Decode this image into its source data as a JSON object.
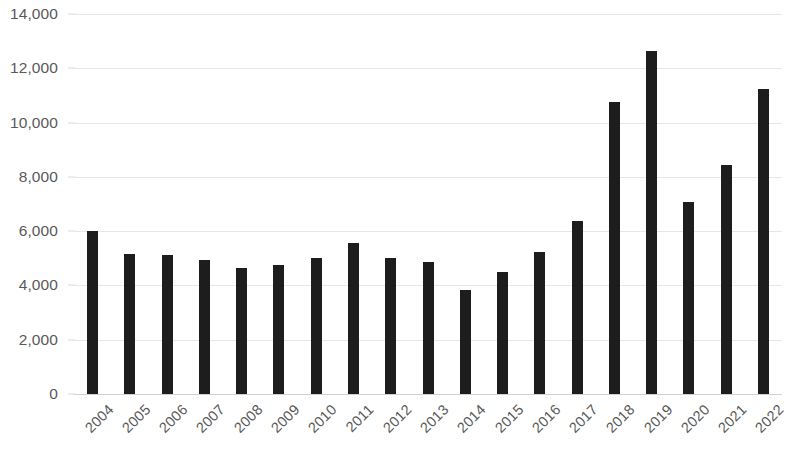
{
  "chart_data": {
    "type": "bar",
    "title": "",
    "subtitle": "",
    "xlabel": "",
    "ylabel": "",
    "legend": [],
    "grid": true,
    "legend_position": "none",
    "bar_color": "#1d1d1d",
    "gridline_color": "#e6e6e6",
    "axis_label_color": "#595959",
    "background_color": "#ffffff",
    "ylim": [
      0,
      14000
    ],
    "ytick_step": 2000,
    "ytick_labels": [
      "14,000",
      "12,000",
      "10,000",
      "8,000",
      "6,000",
      "4,000",
      "2,000",
      "0"
    ],
    "ytick_values": [
      14000,
      12000,
      10000,
      8000,
      6000,
      4000,
      2000,
      0
    ],
    "categories": [
      "2004",
      "2005",
      "2006",
      "2007",
      "2008",
      "2009",
      "2010",
      "2011",
      "2012",
      "2013",
      "2014",
      "2015",
      "2016",
      "2017",
      "2018",
      "2019",
      "2020",
      "2021",
      "2022"
    ],
    "values": [
      6020,
      5160,
      5120,
      4950,
      4640,
      4760,
      5000,
      5580,
      5000,
      4870,
      3830,
      4480,
      5240,
      6360,
      10760,
      12620,
      7060,
      8430,
      11250
    ],
    "xtick_rotation_degrees": -45
  }
}
